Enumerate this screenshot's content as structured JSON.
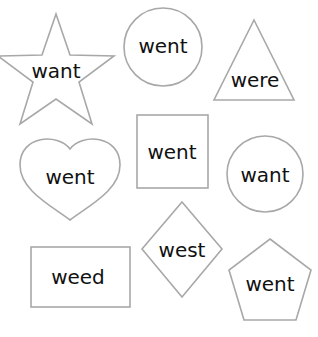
{
  "worksheet": {
    "shapes": [
      {
        "shape": "star",
        "word": "want"
      },
      {
        "shape": "circle",
        "word": "went"
      },
      {
        "shape": "triangle",
        "word": "were"
      },
      {
        "shape": "heart",
        "word": "went"
      },
      {
        "shape": "square",
        "word": "went"
      },
      {
        "shape": "circle",
        "word": "want"
      },
      {
        "shape": "rectangle",
        "word": "weed"
      },
      {
        "shape": "diamond",
        "word": "west"
      },
      {
        "shape": "pentagon",
        "word": "went"
      }
    ],
    "colors": {
      "outline": "#a8a8a8",
      "text": "#111111",
      "background": "#ffffff"
    }
  }
}
